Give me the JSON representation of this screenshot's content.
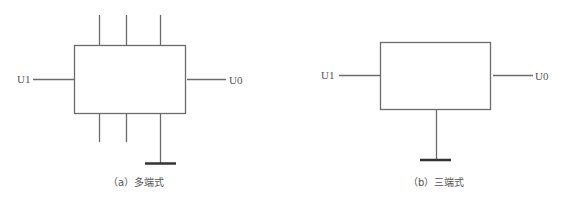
{
  "diagrams": [
    {
      "id": "a",
      "caption": "（a）多端式",
      "input_label": "U1",
      "output_label": "U0",
      "top_terminals": 3,
      "bottom_terminals": 2,
      "ground": true
    },
    {
      "id": "b",
      "caption": "（b）三端式",
      "input_label": "U1",
      "output_label": "U0",
      "top_terminals": 0,
      "bottom_terminals": 0,
      "ground": true
    }
  ],
  "colors": {
    "stroke": "#6b6b6b",
    "ground": "#333333",
    "text": "#555555"
  }
}
